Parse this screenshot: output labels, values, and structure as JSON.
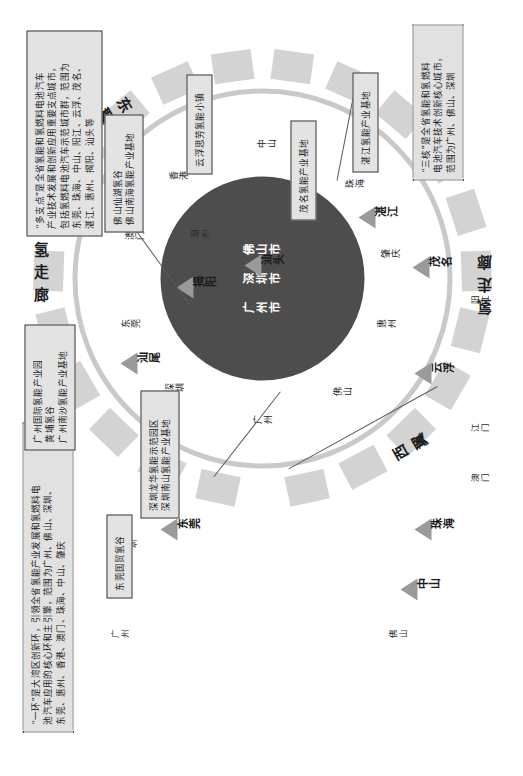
{
  "diagram": {
    "center_cities": [
      "广州市",
      "深圳市",
      "佛山市"
    ],
    "inner_ring_cities": [
      "广州",
      "深圳",
      "东莞",
      "澳门",
      "香港",
      "中山",
      "珠海",
      "肇庆",
      "惠州",
      "佛山"
    ],
    "corridor_east": "东翼氢走廊",
    "corridor_west": "西翼氢走廊",
    "ring_words": {
      "east_top": "氢 走 廊",
      "east_name": "东 翼",
      "west_bottom": "氢 走 廊",
      "west_name": "西 翼"
    }
  },
  "callouts": [
    {
      "id": "one-ring",
      "style": "dotted",
      "lines": [
        "“一环”是大湾区创新环，引领全省氢能产业发展和氢燃料电",
        "池汽车应用的核心环和主引擎，范围为广州、佛山、深圳、",
        "东莞、惠州、香港、澳门、珠海、中山、肇庆"
      ]
    },
    {
      "id": "three-core",
      "style": "dotted",
      "lines": [
        "“三核”是全省氢能和氢燃料",
        "电池汽车技术创新核心城市，",
        "范围为广州、佛山、深圳"
      ]
    },
    {
      "id": "multi-node",
      "style": "solid",
      "lines": [
        "“多支点”是全省氢能和氢燃料电池汽车",
        "产业技术发展和创新应用重要支点城市，",
        "包括氢燃料电池汽车示范城市群，范围为",
        "东莞、珠海、中山、阳江、云浮、茂名、",
        "湛江、惠州、揭阳、汕头等"
      ]
    },
    {
      "id": "shenzhen-parks",
      "style": "solid",
      "lines": [
        "深圳龙华氢能示范园区",
        "深圳南山氢能产业基地"
      ]
    },
    {
      "id": "dongguan-park",
      "style": "solid",
      "lines": [
        "东莞国贸氢谷"
      ]
    },
    {
      "id": "guangzhou-parks",
      "style": "solid",
      "lines": [
        "广州国际氢能产业园",
        "黄埔氢谷",
        "广州南沙氢能产业基地"
      ]
    },
    {
      "id": "foshan-parks",
      "style": "solid",
      "lines": [
        "佛山仙湖氢谷",
        "佛山南海氢能产业基地"
      ]
    },
    {
      "id": "yunfu-town",
      "style": "solid",
      "lines": [
        "云浮思劳氢能小镇"
      ]
    },
    {
      "id": "maoming-base",
      "style": "solid",
      "lines": [
        "茂名氢能产业基地"
      ]
    },
    {
      "id": "zhanjiang-base",
      "style": "solid",
      "lines": [
        "湛江氢能产业基地"
      ]
    }
  ],
  "markers": [
    {
      "id": "dongguan",
      "label": "东莞",
      "emphasis": true
    },
    {
      "id": "jieyang",
      "label": "揭阳",
      "emphasis": true
    },
    {
      "id": "shantou",
      "label": "汕头",
      "emphasis": true
    },
    {
      "id": "shanwei",
      "label": "汕尾",
      "emphasis": false
    },
    {
      "id": "chaozhou",
      "label": "潮州",
      "emphasis": false
    },
    {
      "id": "zhanjiang",
      "label": "湛江",
      "emphasis": true
    },
    {
      "id": "maoming",
      "label": "茂名",
      "emphasis": true
    },
    {
      "id": "yangjiang",
      "label": "阳江",
      "emphasis": false
    },
    {
      "id": "yunfu",
      "label": "云浮",
      "emphasis": true
    },
    {
      "id": "jiangmen",
      "label": "江门",
      "emphasis": false
    },
    {
      "id": "macau",
      "label": "澳门",
      "emphasis": false
    },
    {
      "id": "zhuhai",
      "label": "珠海",
      "emphasis": true
    },
    {
      "id": "zhongshan",
      "label": "中山",
      "emphasis": true
    },
    {
      "id": "foshan",
      "label": "佛山",
      "emphasis": false
    },
    {
      "id": "guangzhou",
      "label": "广州",
      "emphasis": false
    },
    {
      "id": "shenzhen",
      "label": "深圳",
      "emphasis": false
    },
    {
      "id": "hongkong",
      "label": "香港",
      "emphasis": false
    },
    {
      "id": "huizhou",
      "label": "惠州",
      "emphasis": false
    }
  ],
  "colors": {
    "center_fill": "#4d4d4d",
    "ring_stroke": "#c9c9c9",
    "segment_fill": "#d3d3d3",
    "box_fill": "#e3e3e3",
    "marker_fill": "#9a9a9a",
    "text": "#1a1a1a"
  }
}
